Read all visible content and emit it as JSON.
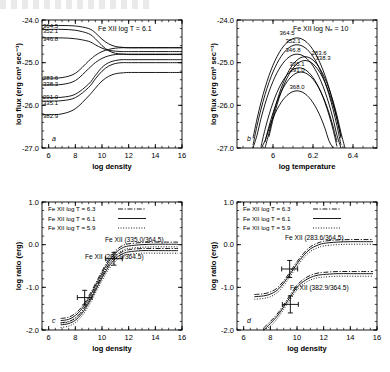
{
  "figure": {
    "panels": [
      "a",
      "b",
      "c",
      "d"
    ]
  },
  "chart_data": [
    {
      "type": "line",
      "panel_label": "a",
      "title": "Fe XII   log T = 6.1",
      "xlabel": "log density",
      "ylabel": "log flux (erg cm³ sec⁻¹)",
      "xlim": [
        5.5,
        16
      ],
      "ylim": [
        -27.0,
        -24.0
      ],
      "xticks": [
        6,
        8,
        10,
        12,
        14,
        16
      ],
      "xticklabels": [
        "6",
        "8",
        "10",
        "12",
        "14",
        "16"
      ],
      "yticks": [
        -24.0,
        -25.0,
        -26.0,
        -27.0
      ],
      "yticklabels": [
        "-24.0",
        "-25.0",
        "-26.0",
        "-27.0"
      ],
      "grid": false,
      "legend": "none",
      "curve_labels": [
        "364.5",
        "352.1",
        "346.8",
        "283.6",
        "338.3",
        "291.0",
        "335.1",
        "382.9"
      ],
      "series": [
        {
          "name": "364.5",
          "x": [
            5.5,
            6,
            7,
            8,
            9,
            9.5,
            10,
            10.5,
            11,
            11.5,
            12,
            13,
            14,
            15,
            16
          ],
          "values": [
            -24.13,
            -24.13,
            -24.13,
            -24.14,
            -24.2,
            -24.3,
            -24.45,
            -24.56,
            -24.62,
            -24.64,
            -24.65,
            -24.65,
            -24.65,
            -24.65,
            -24.65
          ]
        },
        {
          "name": "352.1",
          "x": [
            5.5,
            6,
            7,
            8,
            9,
            9.5,
            10,
            10.5,
            11,
            11.5,
            12,
            13,
            14,
            15,
            16
          ],
          "values": [
            -24.22,
            -24.22,
            -24.22,
            -24.24,
            -24.32,
            -24.44,
            -24.6,
            -24.72,
            -24.78,
            -24.8,
            -24.81,
            -24.81,
            -24.81,
            -24.81,
            -24.81
          ]
        },
        {
          "name": "346.8",
          "x": [
            5.5,
            6,
            7,
            8,
            9,
            9.5,
            10,
            10.5,
            11,
            11.5,
            12,
            13,
            14,
            15,
            16
          ],
          "values": [
            -24.42,
            -24.42,
            -24.42,
            -24.44,
            -24.5,
            -24.58,
            -24.66,
            -24.71,
            -24.73,
            -24.74,
            -24.74,
            -24.74,
            -24.74,
            -24.74,
            -24.74
          ]
        },
        {
          "name": "283.6",
          "x": [
            5.5,
            6,
            7,
            8,
            9,
            9.5,
            10,
            10.5,
            11,
            11.5,
            12,
            13,
            14,
            15,
            16
          ],
          "values": [
            -25.36,
            -25.36,
            -25.35,
            -25.25,
            -24.96,
            -24.83,
            -24.74,
            -24.69,
            -24.66,
            -24.65,
            -24.65,
            -24.65,
            -24.65,
            -24.65,
            -24.65
          ]
        },
        {
          "name": "338.3",
          "x": [
            5.5,
            6,
            7,
            8,
            9,
            9.5,
            10,
            10.5,
            11,
            11.5,
            12,
            13,
            14,
            15,
            16
          ],
          "values": [
            -25.52,
            -25.52,
            -25.51,
            -25.42,
            -25.14,
            -25.0,
            -24.9,
            -24.84,
            -24.81,
            -24.8,
            -24.8,
            -24.8,
            -24.8,
            -24.8,
            -24.8
          ]
        },
        {
          "name": "291.0",
          "x": [
            5.5,
            6,
            7,
            8,
            9,
            9.5,
            10,
            10.5,
            11,
            11.5,
            12,
            13,
            14,
            15,
            16
          ],
          "values": [
            -25.82,
            -25.82,
            -25.81,
            -25.74,
            -25.5,
            -25.3,
            -25.11,
            -25.0,
            -24.95,
            -24.93,
            -24.93,
            -24.93,
            -24.93,
            -24.93,
            -24.93
          ]
        },
        {
          "name": "335.1",
          "x": [
            5.5,
            6,
            7,
            8,
            9,
            9.5,
            10,
            10.5,
            11,
            11.5,
            12,
            13,
            14,
            15,
            16
          ],
          "values": [
            -25.9,
            -25.9,
            -25.89,
            -25.82,
            -25.58,
            -25.38,
            -25.2,
            -25.08,
            -25.02,
            -25.0,
            -25.0,
            -25.0,
            -25.0,
            -25.0,
            -25.0
          ]
        },
        {
          "name": "382.9",
          "x": [
            5.5,
            6,
            7,
            8,
            9,
            9.5,
            10,
            10.5,
            11,
            11.5,
            12,
            13,
            14,
            15,
            16
          ],
          "values": [
            -26.22,
            -26.22,
            -26.2,
            -26.08,
            -25.78,
            -25.6,
            -25.43,
            -25.32,
            -25.26,
            -25.24,
            -25.23,
            -25.23,
            -25.23,
            -25.23,
            -25.23
          ]
        }
      ]
    },
    {
      "type": "line",
      "panel_label": "b",
      "title": "Fe XII   log Nₑ = 10",
      "xlabel": "log temperature",
      "ylabel": "log flux (erg cm³ sec⁻¹)",
      "xlim": [
        5.82,
        6.52
      ],
      "ylim": [
        -27.0,
        -24.0
      ],
      "xticks": [
        6.0,
        6.2,
        6.4
      ],
      "xticklabels": [
        "6",
        "6.2",
        "6.4"
      ],
      "yticks": [
        -24.0,
        -25.0,
        -26.0,
        -27.0
      ],
      "yticklabels": [
        "-24.0",
        "-25.0",
        "-26.0",
        "-27.0"
      ],
      "grid": false,
      "legend": "none",
      "curve_labels": [
        "364.5",
        "352.1",
        "346.8",
        "283.6",
        "338.3",
        "335.1",
        "291.0",
        "368.0"
      ],
      "series": [
        {
          "name": "364.5",
          "peak_x": 6.12,
          "peak_y": -24.42,
          "width": 0.27
        },
        {
          "name": "352.1",
          "peak_x": 6.12,
          "peak_y": -24.58,
          "width": 0.27
        },
        {
          "name": "346.8",
          "peak_x": 6.12,
          "peak_y": -24.8,
          "width": 0.27
        },
        {
          "name": "283.6",
          "peak_x": 6.16,
          "peak_y": -24.86,
          "width": 0.25
        },
        {
          "name": "338.3",
          "peak_x": 6.16,
          "peak_y": -24.95,
          "width": 0.25
        },
        {
          "name": "335.1",
          "peak_x": 6.13,
          "peak_y": -25.12,
          "width": 0.26
        },
        {
          "name": "291.0",
          "peak_x": 6.14,
          "peak_y": -25.22,
          "width": 0.26
        },
        {
          "name": "368.0",
          "peak_x": 6.12,
          "peak_y": -25.66,
          "width": 0.27
        }
      ]
    },
    {
      "type": "line",
      "panel_label": "c",
      "xlabel": "log density",
      "ylabel": "log ratio (erg)",
      "xlim": [
        5.5,
        16
      ],
      "ylim": [
        -2.0,
        1.0
      ],
      "xticks": [
        6,
        8,
        10,
        12,
        14,
        16
      ],
      "xticklabels": [
        "6",
        "8",
        "10",
        "12",
        "14",
        "16"
      ],
      "yticks": [
        1.0,
        0.0,
        -1.0,
        -2.0
      ],
      "yticklabels": [
        "1.0",
        "0.0",
        "-1.0",
        "-2.0"
      ],
      "grid": false,
      "legend_position": "upper-left",
      "legend": [
        {
          "label": "Fe XII   log T = 6.3",
          "style": "dash-dot"
        },
        {
          "label": "Fe XII   log T = 6.1",
          "style": "solid"
        },
        {
          "label": "Fe XII   log T = 5.9",
          "style": "dotted"
        }
      ],
      "annotations": [
        "Fe XII (335.0/364.5)",
        "Fe XII (291.0/364.5)"
      ],
      "series": [
        {
          "name": "335.0/364.5",
          "x": [
            6.9,
            7.5,
            8,
            8.5,
            9,
            9.5,
            10,
            10.5,
            11,
            11.5,
            12,
            13,
            14,
            15,
            15.7
          ],
          "values": [
            -1.78,
            -1.75,
            -1.66,
            -1.5,
            -1.26,
            -0.97,
            -0.67,
            -0.4,
            -0.2,
            -0.08,
            -0.03,
            0.0,
            0.01,
            0.01,
            0.01
          ]
        },
        {
          "name": "291.0/364.5",
          "x": [
            6.9,
            7.5,
            8,
            8.5,
            9,
            9.5,
            10,
            10.5,
            11,
            11.5,
            12,
            13,
            14,
            15,
            15.7
          ],
          "values": [
            -1.88,
            -1.85,
            -1.77,
            -1.61,
            -1.37,
            -1.08,
            -0.78,
            -0.52,
            -0.33,
            -0.22,
            -0.17,
            -0.14,
            -0.14,
            -0.14,
            -0.14
          ]
        }
      ],
      "data_points": [
        {
          "x": 8.7,
          "y": -1.24,
          "xerr": 0.55,
          "yerr": 0.17
        },
        {
          "x": 10.9,
          "y": -0.33,
          "xerr": 0.62,
          "yerr": 0.15
        }
      ]
    },
    {
      "type": "line",
      "panel_label": "d",
      "xlabel": "log density",
      "ylabel": "log ratio (erg)",
      "xlim": [
        5.5,
        16
      ],
      "ylim": [
        -2.0,
        1.0
      ],
      "xticks": [
        6,
        8,
        10,
        12,
        14,
        16
      ],
      "xticklabels": [
        "6",
        "8",
        "10",
        "12",
        "14",
        "16"
      ],
      "yticks": [
        1.0,
        0.0,
        -1.0,
        -2.0
      ],
      "yticklabels": [
        "1.0",
        "0.0",
        "-1.0",
        "-2.0"
      ],
      "grid": false,
      "legend_position": "upper-left",
      "legend": [
        {
          "label": "Fe XII   log T = 6.3",
          "style": "dash-dot"
        },
        {
          "label": "Fe XII   log T = 6.1",
          "style": "solid"
        },
        {
          "label": "Fe XII   log T = 5.9",
          "style": "dotted"
        }
      ],
      "annotations": [
        "Fe XII (283.6/364.5)",
        "Fe XII (382.9/364.5)"
      ],
      "series": [
        {
          "name": "283.6/364.5",
          "x": [
            6.8,
            7.5,
            8,
            8.5,
            9,
            9.5,
            10,
            10.5,
            11,
            11.5,
            12,
            13,
            14,
            15,
            15.7
          ],
          "values": [
            -1.22,
            -1.2,
            -1.16,
            -1.07,
            -0.9,
            -0.68,
            -0.45,
            -0.25,
            -0.1,
            -0.02,
            0.03,
            0.06,
            0.07,
            0.07,
            0.07
          ]
        },
        {
          "name": "382.9/364.5",
          "x": [
            7.5,
            8,
            8.5,
            9,
            9.5,
            10,
            10.5,
            11,
            11.5,
            12,
            13,
            14,
            15,
            15.7
          ],
          "values": [
            -2.0,
            -1.85,
            -1.68,
            -1.46,
            -1.22,
            -1.0,
            -0.86,
            -0.77,
            -0.72,
            -0.7,
            -0.68,
            -0.68,
            -0.68,
            -0.68
          ]
        }
      ],
      "data_points": [
        {
          "x": 9.45,
          "y": -0.57,
          "xerr": 0.6,
          "yerr": 0.2
        },
        {
          "x": 9.5,
          "y": -1.4,
          "xerr": 0.6,
          "yerr": 0.2
        }
      ]
    }
  ]
}
